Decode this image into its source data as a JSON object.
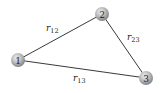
{
  "diagram": {
    "type": "graph",
    "nodes": [
      {
        "id": "1",
        "label": "1",
        "x": 18,
        "y": 60
      },
      {
        "id": "2",
        "label": "2",
        "x": 102,
        "y": 14
      },
      {
        "id": "3",
        "label": "3",
        "x": 146,
        "y": 78
      }
    ],
    "edges": [
      {
        "from": "1",
        "to": "2",
        "label": "r",
        "sub": "12"
      },
      {
        "from": "2",
        "to": "3",
        "label": "r",
        "sub": "23"
      },
      {
        "from": "1",
        "to": "3",
        "label": "r",
        "sub": "13"
      }
    ],
    "colors": {
      "node_fill_light": "#e6e6e6",
      "node_fill_dark": "#8c8c8c",
      "edge": "#3a3a3a"
    }
  }
}
